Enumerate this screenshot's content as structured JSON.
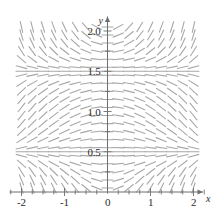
{
  "figure": {
    "title": "",
    "background_color": "#ffffff",
    "segment_color": "#a8a8a8",
    "axis_color": "#6e6e6e",
    "text_color": "#2b2b2b"
  },
  "axes": {
    "x_axis_label": "x",
    "y_axis_label": "y",
    "x_ticks": [
      {
        "value": -2,
        "label": "-2"
      },
      {
        "value": -1,
        "label": "-1"
      },
      {
        "value": 0,
        "label": "0"
      },
      {
        "value": 1,
        "label": "1"
      },
      {
        "value": 2,
        "label": "2"
      }
    ],
    "y_ticks": [
      {
        "value": 0.5,
        "label": "0.5"
      },
      {
        "value": 1.0,
        "label": "1.0"
      },
      {
        "value": 1.5,
        "label": "1.5"
      },
      {
        "value": 2.0,
        "label": "2.0"
      }
    ],
    "x_minor_tick_step": 0.25,
    "y_minor_tick_step": 0.25,
    "grid": false
  },
  "chart_data": {
    "type": "scatter",
    "subtype": "direction-field",
    "title": "",
    "xlabel": "x",
    "ylabel": "y",
    "xlim": [
      -2.25,
      2.25
    ],
    "ylim": [
      -0.05,
      2.15
    ],
    "categories": [],
    "values": [],
    "grid": false,
    "legend": null,
    "equilibrium_lines": [
      0.5,
      1.5
    ],
    "slope_formula": "dy/dx = x*(y-0.5)*(y-1.5)",
    "sample_x": [
      -2.0,
      -1.75,
      -1.5,
      -1.25,
      -1.0,
      -0.75,
      -0.5,
      -0.25,
      0.0,
      0.25,
      0.5,
      0.75,
      1.0,
      1.25,
      1.5,
      1.75,
      2.0
    ],
    "sample_y": [
      0.05,
      0.15,
      0.25,
      0.35,
      0.45,
      0.5,
      0.55,
      0.65,
      0.75,
      0.85,
      0.95,
      1.05,
      1.15,
      1.25,
      1.35,
      1.45,
      1.5,
      1.55,
      1.65,
      1.75,
      1.85,
      1.95,
      2.05
    ],
    "segment_length_px": 11
  }
}
